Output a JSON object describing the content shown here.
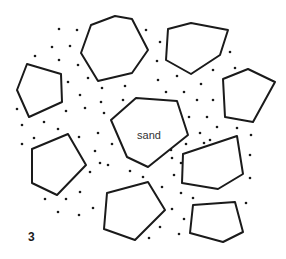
{
  "figure": {
    "number": "3",
    "center_label": "sand",
    "colors": {
      "stroke": "#1a1a1a",
      "background": "#ffffff",
      "text": "#333333"
    },
    "stones": [
      {
        "name": "stone-top-center",
        "points": "91,25 115,16 132,19 148,50 132,73 98,81 81,53"
      },
      {
        "name": "stone-top-right",
        "points": "168,29 191,23 228,30 220,55 191,74 166,60"
      },
      {
        "name": "stone-left",
        "points": "27,64 61,74 62,102 29,117 17,90"
      },
      {
        "name": "stone-right",
        "points": "223,79 248,69 275,82 253,122 225,117"
      },
      {
        "name": "stone-center-sand",
        "points": "136,98 177,101 188,135 148,167 127,157 111,120"
      },
      {
        "name": "stone-bottom-left",
        "points": "32,149 68,134 86,165 57,195 32,183"
      },
      {
        "name": "stone-middle-right",
        "points": "183,154 237,136 243,174 218,189 182,183"
      },
      {
        "name": "stone-bottom-center",
        "points": "107,193 148,182 165,210 135,240 104,229"
      },
      {
        "name": "stone-bottom-right",
        "points": "193,205 235,202 243,232 223,242 190,233"
      }
    ],
    "grains": [
      [
        59,
        29
      ],
      [
        77,
        30
      ],
      [
        52,
        47
      ],
      [
        70,
        46
      ],
      [
        35,
        56
      ],
      [
        59,
        60
      ],
      [
        78,
        65
      ],
      [
        88,
        78
      ],
      [
        68,
        82
      ],
      [
        80,
        95
      ],
      [
        17,
        109
      ],
      [
        66,
        111
      ],
      [
        85,
        108
      ],
      [
        22,
        125
      ],
      [
        44,
        122
      ],
      [
        58,
        129
      ],
      [
        146,
        30
      ],
      [
        160,
        42
      ],
      [
        157,
        61
      ],
      [
        230,
        52
      ],
      [
        213,
        70
      ],
      [
        235,
        68
      ],
      [
        158,
        80
      ],
      [
        177,
        76
      ],
      [
        201,
        84
      ],
      [
        166,
        92
      ],
      [
        184,
        92
      ],
      [
        197,
        100
      ],
      [
        213,
        100
      ],
      [
        189,
        117
      ],
      [
        207,
        117
      ],
      [
        217,
        127
      ],
      [
        237,
        128
      ],
      [
        102,
        88
      ],
      [
        125,
        86
      ],
      [
        101,
        102
      ],
      [
        123,
        100
      ],
      [
        104,
        113
      ],
      [
        100,
        163
      ],
      [
        22,
        144
      ],
      [
        34,
        138
      ],
      [
        79,
        137
      ],
      [
        98,
        133
      ],
      [
        95,
        151
      ],
      [
        112,
        144
      ],
      [
        108,
        165
      ],
      [
        90,
        172
      ],
      [
        130,
        171
      ],
      [
        143,
        177
      ],
      [
        80,
        192
      ],
      [
        45,
        199
      ],
      [
        66,
        199
      ],
      [
        58,
        212
      ],
      [
        79,
        215
      ],
      [
        93,
        208
      ],
      [
        200,
        133
      ],
      [
        210,
        140
      ],
      [
        251,
        135
      ],
      [
        186,
        144
      ],
      [
        157,
        159
      ],
      [
        171,
        150
      ],
      [
        250,
        155
      ],
      [
        174,
        175
      ],
      [
        250,
        178
      ],
      [
        162,
        187
      ],
      [
        181,
        193
      ],
      [
        193,
        198
      ],
      [
        246,
        203
      ],
      [
        172,
        209
      ],
      [
        184,
        219
      ],
      [
        160,
        227
      ],
      [
        149,
        238
      ],
      [
        179,
        234
      ],
      [
        204,
        143
      ],
      [
        172,
        158
      ],
      [
        181,
        163
      ]
    ],
    "label_position": [
      149,
      139
    ],
    "number_position": [
      28,
      241
    ]
  }
}
